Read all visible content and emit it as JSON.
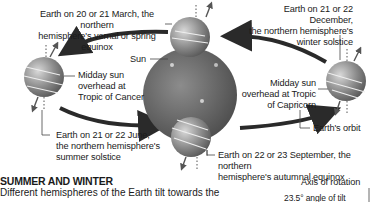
{
  "diagram": {
    "labels": {
      "march": "Earth on 20 or 21 March, the northern hemisphere's vernal or spring equinox",
      "march_line1": "Earth on 20 or 21 March, the northern",
      "march_line2": "hemisphere's vernal or spring equinox",
      "december_line1": "Earth on 21 or 22 December,",
      "december_line2": "the northern hemisphere's",
      "december_line3": "winter solstice",
      "sun": "Sun",
      "cancer_line1": "Midday sun",
      "cancer_line2": "overhead at",
      "cancer_line3": "Tropic of Cancer",
      "capricorn_line1": "Midday sun",
      "capricorn_line2": "overhead at Tropic",
      "capricorn_line3": "of Capricorn",
      "orbit": "Earth's orbit",
      "june_line1": "Earth on 21 or 22 June,",
      "june_line2": "the northern hemisphere's",
      "june_line3": "summer solstice",
      "september_line1": "Earth on 22 or 23 September, the northern",
      "september_line2": "hemisphere's autumnal equinox",
      "axis": "Axis of rotation",
      "tilt": "23.5° angle of tilt"
    },
    "colors": {
      "sun": "#6e6e6e",
      "earth": "#8a8a8a",
      "arrow": "#2a2a2a",
      "text": "#1a1a1a"
    }
  },
  "section": {
    "title": "SUMMER AND WINTER",
    "body": "Different hemispheres of the Earth tilt towards the"
  }
}
